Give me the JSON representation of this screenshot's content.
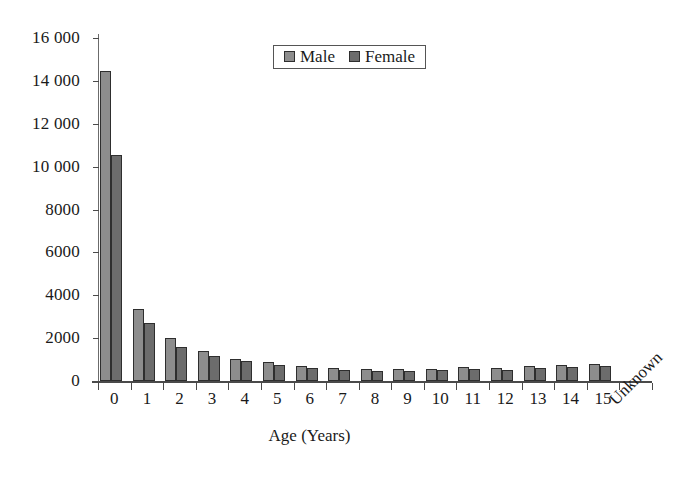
{
  "chart_data": {
    "type": "bar",
    "title": "",
    "xlabel": "Age (Years)",
    "ylabel": "",
    "ylim": [
      0,
      16000
    ],
    "ytick_values": [
      0,
      2000,
      4000,
      6000,
      8000,
      10000,
      12000,
      14000,
      16000
    ],
    "ytick_labels": [
      "0",
      "2000",
      "4000",
      "6000",
      "8000",
      "10 000",
      "12 000",
      "14 000",
      "16 000"
    ],
    "grid": false,
    "legend_position": "top-center",
    "categories": [
      "0",
      "1",
      "2",
      "3",
      "4",
      "5",
      "6",
      "7",
      "8",
      "9",
      "10",
      "11",
      "12",
      "13",
      "14",
      "15",
      "Unknown"
    ],
    "series": [
      {
        "name": "Male",
        "color": "#8d8d8d",
        "values": [
          14450,
          3350,
          2000,
          1400,
          1050,
          900,
          700,
          600,
          550,
          550,
          550,
          650,
          600,
          700,
          750,
          800,
          0
        ]
      },
      {
        "name": "Female",
        "color": "#6c6c6c",
        "values": [
          10550,
          2700,
          1600,
          1150,
          950,
          750,
          600,
          500,
          480,
          480,
          500,
          550,
          520,
          620,
          650,
          680,
          0
        ]
      }
    ]
  },
  "legend": {
    "items": [
      {
        "label": "Male",
        "swatch": "male-swatch"
      },
      {
        "label": "Female",
        "swatch": "female-swatch"
      }
    ]
  },
  "axis": {
    "x_title": "Age (Years)",
    "unknown_label": "Unknown"
  }
}
